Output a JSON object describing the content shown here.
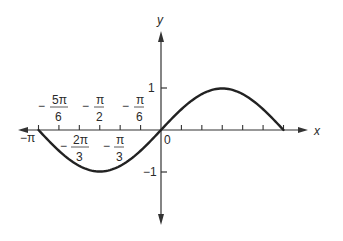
{
  "chart_data": {
    "type": "line",
    "title": "",
    "function": "y = sin(x)",
    "xlabel": "x",
    "ylabel": "y",
    "xlim": [
      -3.14159,
      3.14159
    ],
    "ylim": [
      -1,
      1
    ],
    "grid": false,
    "legend": null,
    "x_tick_labels_above": [
      {
        "num": "5π",
        "den": "6",
        "sign": "−",
        "value": -2.618
      },
      {
        "num": "π",
        "den": "2",
        "sign": "−",
        "value": -1.5708
      },
      {
        "num": "π",
        "den": "6",
        "sign": "−",
        "value": -0.5236
      }
    ],
    "x_tick_labels_below": [
      {
        "text": "−π",
        "value": -3.14159
      },
      {
        "num": "2π",
        "den": "3",
        "sign": "−",
        "value": -2.0944
      },
      {
        "num": "π",
        "den": "3",
        "sign": "−",
        "value": -1.0472
      }
    ],
    "origin_label": "0",
    "y_tick_labels": [
      {
        "text": "1",
        "value": 1
      },
      {
        "text": "−1",
        "value": -1
      }
    ],
    "x_ticks_per_unit": "π/6",
    "series": [
      {
        "name": "sin(x)",
        "x": [
          -3.1416,
          -2.618,
          -2.0944,
          -1.5708,
          -1.0472,
          -0.5236,
          0,
          0.5236,
          1.0472,
          1.5708,
          2.0944,
          2.618,
          3.1416
        ],
        "y": [
          0,
          -0.5,
          -0.866,
          -1,
          -0.866,
          -0.5,
          0,
          0.5,
          0.866,
          1,
          0.866,
          0.5,
          0
        ]
      }
    ]
  }
}
